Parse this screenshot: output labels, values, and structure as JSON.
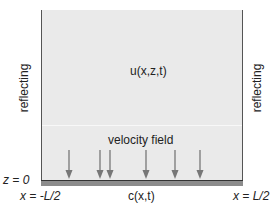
{
  "diagram": {
    "field_label": "u(x,z,t)",
    "velocity_label": "velocity field",
    "left_boundary": "reflecting",
    "right_boundary": "reflecting",
    "bottom_label": "z = 0",
    "left_x_label": "x = -L/2",
    "right_x_label": "x = L/2",
    "surface_label": "c(x,t)",
    "arrows": [
      {
        "x": 69
      },
      {
        "x": 100
      },
      {
        "x": 110
      },
      {
        "x": 146
      },
      {
        "x": 175
      },
      {
        "x": 200
      }
    ],
    "colors": {
      "domain_fill": "#eaeaea",
      "ground_fill": "#8c8c8c",
      "arrow": "#777777",
      "border": "#555555"
    }
  }
}
